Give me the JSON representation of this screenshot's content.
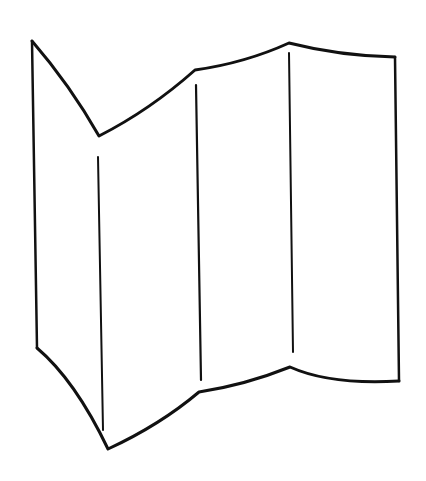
{
  "illustration": {
    "subject": "folding-screen",
    "panel_count": 4,
    "stroke_color": "#111111",
    "background_color": "#ffffff"
  }
}
